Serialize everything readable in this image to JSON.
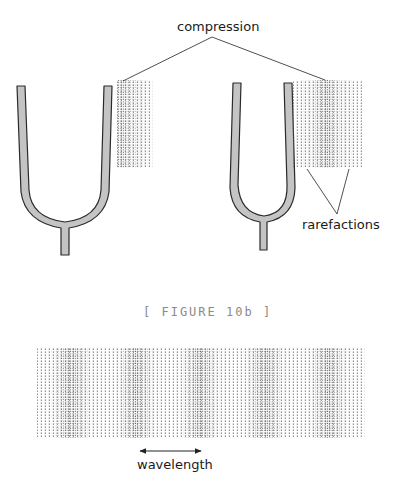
{
  "labels": {
    "compression": "compression",
    "rarefactions": "rarefactions",
    "figure_caption": "[ FIGURE 10b ]",
    "wavelength": "wavelength"
  },
  "colors": {
    "fork_fill": "#c4c4c4",
    "fork_stroke": "#2a2a2a",
    "dot": "#555555",
    "caption": "#8a8a8a",
    "line": "#222222"
  },
  "figure": {
    "left_fork": {
      "compression_band": "near prong (left edge of block)"
    },
    "right_fork": {
      "compression_band": "center of block"
    },
    "wave": {
      "compression_count": 5,
      "compression_centers_x": [
        70,
        136,
        200,
        265,
        328
      ]
    }
  }
}
